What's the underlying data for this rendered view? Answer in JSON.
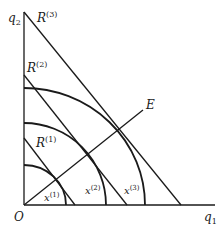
{
  "diagram": {
    "axes": {
      "origin_label": "O",
      "x_label": "q",
      "x_label_sub": "1",
      "y_label": "q",
      "y_label_sub": "2"
    },
    "budget_lines": [
      {
        "label": "R",
        "sup": "(1)"
      },
      {
        "label": "R",
        "sup": "(2)"
      },
      {
        "label": "R",
        "sup": "(3)"
      }
    ],
    "isoquants": [
      {
        "label": "x",
        "sup": "(1)"
      },
      {
        "label": "x",
        "sup": "(2)"
      },
      {
        "label": "x",
        "sup": "(3)"
      }
    ],
    "expansion_path": {
      "label": "E"
    },
    "line_color": "#1a1a1a"
  }
}
